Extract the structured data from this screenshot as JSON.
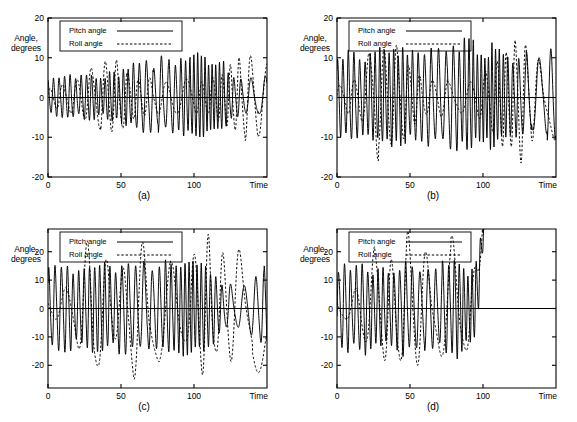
{
  "figure": {
    "panels": [
      {
        "id": "a",
        "caption": "(a)",
        "ylabel": "Angle,\ndegrees",
        "xlabel": "Time",
        "legend": {
          "pitch": "Pitch angle",
          "roll": "Roll angle"
        }
      },
      {
        "id": "b",
        "caption": "(b)",
        "ylabel": "Angle,\ndegrees",
        "xlabel": "Time",
        "legend": {
          "pitch": "Pitch angle",
          "roll": "Roll angle"
        }
      },
      {
        "id": "c",
        "caption": "(c)",
        "ylabel": "Angle,\ndegrees",
        "xlabel": "Time",
        "legend": {
          "pitch": "Pitch angle",
          "roll": "Roll angle"
        }
      },
      {
        "id": "d",
        "caption": "(d)",
        "ylabel": "Angle,\ndegrees",
        "xlabel": "Time",
        "legend": {
          "pitch": "Pitch angle",
          "roll": "Roll angle"
        }
      }
    ]
  },
  "chart_data": [
    {
      "type": "line",
      "panel": "a",
      "title": "(a)",
      "xlabel": "Time",
      "ylabel": "Angle, degrees",
      "xlim": [
        0,
        150
      ],
      "ylim": [
        -20,
        20
      ],
      "xticks": [
        0,
        50,
        100
      ],
      "xticklabels": [
        "0",
        "50",
        "100"
      ],
      "yticks": [
        -20,
        -10,
        0,
        10,
        20
      ],
      "yticklabels": [
        "-20",
        "-10",
        "0",
        "10",
        "20"
      ],
      "grid": false,
      "legend_position": "upper-left-inset",
      "series": [
        {
          "name": "Pitch angle",
          "style": "solid",
          "description": "High-frequency oscillation, period approx 3.5 time units, amplitude grows from about 5 degrees near t=0 to about 9 degrees by t=100, then decays slightly toward t=150",
          "envelope": {
            "t": [
              0,
              10,
              20,
              30,
              40,
              50,
              60,
              70,
              80,
              90,
              100,
              110,
              120,
              130,
              140,
              150
            ],
            "amplitude": [
              4.5,
              4.8,
              4.6,
              5.0,
              5.2,
              6.0,
              7.2,
              8.0,
              8.6,
              8.8,
              9.0,
              8.6,
              7.4,
              5.0,
              4.2,
              5.0
            ]
          },
          "period": 3.6
        },
        {
          "name": "Roll angle",
          "style": "dashed",
          "description": "Lower-frequency modulated oscillation, period approx 9 time units, amplitude between 3 and 10 degrees with beating; peaks near t=40 at about 9 and near t=130 at about 10.5, minimum near t=-10.5 around t=140",
          "envelope": {
            "t": [
              0,
              10,
              20,
              30,
              40,
              50,
              60,
              70,
              80,
              90,
              100,
              110,
              120,
              130,
              140,
              150
            ],
            "amplitude": [
              2.0,
              3.5,
              5.0,
              8.0,
              9.0,
              7.5,
              5.0,
              4.5,
              4.0,
              4.2,
              4.5,
              4.0,
              6.0,
              10.0,
              10.5,
              9.0
            ]
          },
          "period": 9.0
        }
      ]
    },
    {
      "type": "line",
      "panel": "b",
      "title": "(b)",
      "xlabel": "Time",
      "ylabel": "Angle, degrees",
      "xlim": [
        0,
        150
      ],
      "ylim": [
        -20,
        20
      ],
      "xticks": [
        0,
        50,
        100
      ],
      "xticklabels": [
        "0",
        "50",
        "100"
      ],
      "yticks": [
        -20,
        -10,
        0,
        10,
        20
      ],
      "yticklabels": [
        "-20",
        "-10",
        "0",
        "10",
        "20"
      ],
      "grid": false,
      "legend_position": "upper-left-inset",
      "series": [
        {
          "name": "Pitch angle",
          "style": "solid",
          "description": "Sustained high-frequency oscillation, period approx 3.5 time units, amplitude roughly constant near 10 to 12 degrees across the record",
          "envelope": {
            "t": [
              0,
              10,
              20,
              30,
              40,
              50,
              60,
              70,
              80,
              90,
              100,
              110,
              120,
              130,
              140,
              150
            ],
            "amplitude": [
              10.0,
              10.5,
              10.0,
              10.2,
              11.0,
              11.5,
              12.0,
              12.0,
              12.0,
              12.0,
              11.5,
              11.0,
              10.0,
              9.5,
              10.0,
              10.0
            ]
          },
          "period": 3.6
        },
        {
          "name": "Roll angle",
          "style": "dashed",
          "description": "Low-frequency oscillation with intermittent large excursions; peaks about +13 near t=27 and t=41, +16 near t=121; troughs about -13.5 near t=34 and -15 near t=127; otherwise small amplitude around 3 to 5 degrees",
          "envelope": {
            "t": [
              0,
              10,
              20,
              27,
              34,
              41,
              50,
              60,
              70,
              80,
              90,
              100,
              110,
              121,
              127,
              135,
              145,
              150
            ],
            "amplitude": [
              3.0,
              4.5,
              8.0,
              13.0,
              13.5,
              13.0,
              8.0,
              4.0,
              4.0,
              4.0,
              4.5,
              5.0,
              9.0,
              16.0,
              15.0,
              8.0,
              7.0,
              9.0
            ]
          },
          "period": 9.5
        }
      ]
    },
    {
      "type": "line",
      "panel": "c",
      "title": "(c)",
      "xlabel": "Time",
      "ylabel": "Angle, degrees",
      "xlim": [
        0,
        150
      ],
      "ylim": [
        -28,
        28
      ],
      "xticks": [
        0,
        50,
        100
      ],
      "xticklabels": [
        "0",
        "50",
        "100"
      ],
      "yticks": [
        -20,
        -10,
        0,
        10,
        20
      ],
      "yticklabels": [
        "-20",
        "-10",
        "0",
        "10",
        "20"
      ],
      "grid": false,
      "legend_position": "upper-left-inset",
      "series": [
        {
          "name": "Pitch angle",
          "style": "solid",
          "description": "High-frequency oscillation, period approx 4 time units, amplitude about 13 to 15 degrees; briefly flattens near t=118 to t=140 at a positive offset around 10 to 12 degrees",
          "envelope": {
            "t": [
              0,
              10,
              20,
              30,
              40,
              50,
              60,
              70,
              80,
              90,
              100,
              110,
              120,
              130,
              140,
              150
            ],
            "amplitude": [
              14.0,
              13.5,
              13.0,
              14.0,
              14.0,
              13.5,
              14.0,
              14.0,
              13.5,
              14.0,
              14.0,
              13.0,
              8.0,
              6.0,
              10.0,
              15.0
            ]
          },
          "period": 4.0
        },
        {
          "name": "Roll angle",
          "style": "dashed",
          "description": "Large slow oscillation; positive peaks about +23 at t=30, +23 at t=59, +22 at t=76, +23 at t=106, +22 at t=124; deep negative trough about -25 near t=140",
          "envelope": {
            "t": [
              0,
              10,
              20,
              30,
              40,
              50,
              59,
              70,
              76,
              90,
              100,
              106,
              115,
              124,
              135,
              140,
              150
            ],
            "amplitude": [
              3.0,
              5.0,
              12.0,
              23.0,
              14.0,
              12.0,
              23.0,
              16.0,
              22.0,
              14.0,
              16.0,
              23.0,
              18.0,
              22.0,
              20.0,
              25.0,
              16.0
            ]
          },
          "period": 14.0
        }
      ]
    },
    {
      "type": "line",
      "panel": "d",
      "title": "(d)",
      "xlabel": "Time",
      "ylabel": "Angle, degrees",
      "xlim": [
        0,
        150
      ],
      "ylim": [
        -28,
        28
      ],
      "xticks": [
        0,
        50,
        100
      ],
      "xticklabels": [
        "0",
        "50",
        "100"
      ],
      "yticks": [
        -20,
        -10,
        0,
        10,
        20
      ],
      "yticklabels": [
        "-20",
        "-10",
        "0",
        "10",
        "20"
      ],
      "grid": false,
      "legend_position": "upper-left-inset",
      "series": [
        {
          "name": "Pitch angle",
          "style": "solid",
          "description": "High-frequency oscillation, period approx 4 time units, amplitude about 13 to 15 degrees until t=92, then rises monotonically off the top of the axis near t=101 and the trace ends",
          "envelope": {
            "t": [
              0,
              10,
              20,
              30,
              40,
              50,
              60,
              70,
              80,
              90,
              95,
              101
            ],
            "amplitude": [
              14.5,
              13.5,
              13.5,
              13.5,
              13.5,
              14.0,
              13.0,
              14.0,
              15.0,
              12.0,
              18.0,
              28.0
            ]
          },
          "period": 4.0,
          "divergence_t": 101,
          "terminates_at": 101
        },
        {
          "name": "Roll angle",
          "style": "dashed",
          "description": "Slow large oscillation; positive peaks about +21 at t=29, +23 at t=48, +23 at t=78; trough about -20 near t=53; after t=92 it rises monotonically and leaves the top of the axis near t=100, trace ends",
          "envelope": {
            "t": [
              0,
              10,
              20,
              29,
              40,
              48,
              53,
              65,
              78,
              88,
              93,
              100
            ],
            "amplitude": [
              3.0,
              4.0,
              12.0,
              21.0,
              14.0,
              23.0,
              20.0,
              14.0,
              23.0,
              15.0,
              12.0,
              28.0
            ]
          },
          "period": 13.0,
          "divergence_t": 100,
          "terminates_at": 100
        }
      ]
    }
  ]
}
